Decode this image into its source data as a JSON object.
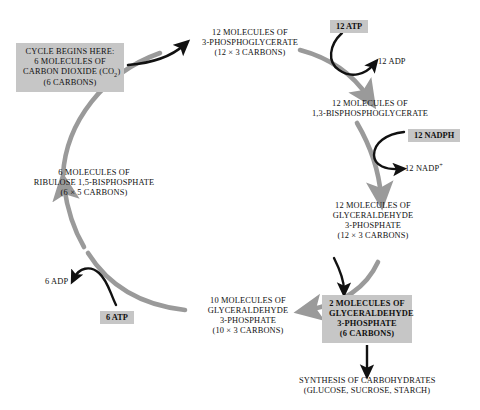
{
  "diagram": {
    "colors": {
      "cycle_arrow": "#9a9a9a",
      "black_arrow": "#000000",
      "box_fill": "#c6c6c6",
      "text": "#111111",
      "background": "#ffffff"
    },
    "nodes": {
      "co2_input": {
        "lines": [
          "CYCLE BEGINS HERE:",
          "6 MOLECULES OF",
          "CARBON DIOXIDE (CO",
          "(6 CARBONS)"
        ],
        "line1": "CYCLE BEGINS HERE:",
        "line2": "6 MOLECULES OF",
        "line3_pre": "CARBON DIOXIDE (CO",
        "line3_sub": "2",
        "line3_post": ")",
        "line4": "(6 CARBONS)",
        "shaded": true
      },
      "pga": {
        "line1": "12 MOLECULES OF",
        "line2": "3-PHOSPHOGLYCERATE",
        "line3": "(12 × 3 CARBONS)",
        "shaded": false
      },
      "bpg": {
        "line1": "12 MOLECULES OF",
        "line2": "1,3-BISPHOSPHOGLYCERATE",
        "shaded": false
      },
      "g3p_12": {
        "line1": "12 MOLECULES OF",
        "line2": "GLYCERALDEHYDE",
        "line3": "3-PHOSPHATE",
        "line4": "(12 × 3 CARBONS)",
        "shaded": false
      },
      "g3p_2": {
        "line1": "2 MOLECULES OF",
        "line2": "GLYCERALDEHYDE",
        "line3": "3-PHOSPHATE",
        "line4": "(6 CARBONS)",
        "shaded": true
      },
      "g3p_10": {
        "line1": "10 MOLECULES OF",
        "line2": "GLYCERALDEHYDE",
        "line3": "3-PHOSPHATE",
        "line4": "(10 × 3 CARBONS)",
        "shaded": false
      },
      "rubp": {
        "line1": "6 MOLECULES OF",
        "line2": "RIBULOSE 1,5-BISPHOSPHATE",
        "line3": "(6 × 5 CARBONS)",
        "shaded": false
      },
      "carbohydrates": {
        "line1": "SYNTHESIS OF CARBOHYDRATES",
        "line2": "(GLUCOSE, SUCROSE, STARCH)",
        "shaded": false
      }
    },
    "cofactors": {
      "atp_12": {
        "label": "12 ATP",
        "shaded": true
      },
      "adp_12": {
        "label": "12 ADP",
        "shaded": false
      },
      "nadph_12": {
        "label": "12 NADPH",
        "shaded": true
      },
      "nadp_12_pre": "12 NADP",
      "nadp_12_sup": "+",
      "atp_6": {
        "label": "6 ATP",
        "shaded": true
      },
      "adp_6": {
        "label": "6 ADP",
        "shaded": false
      }
    }
  }
}
